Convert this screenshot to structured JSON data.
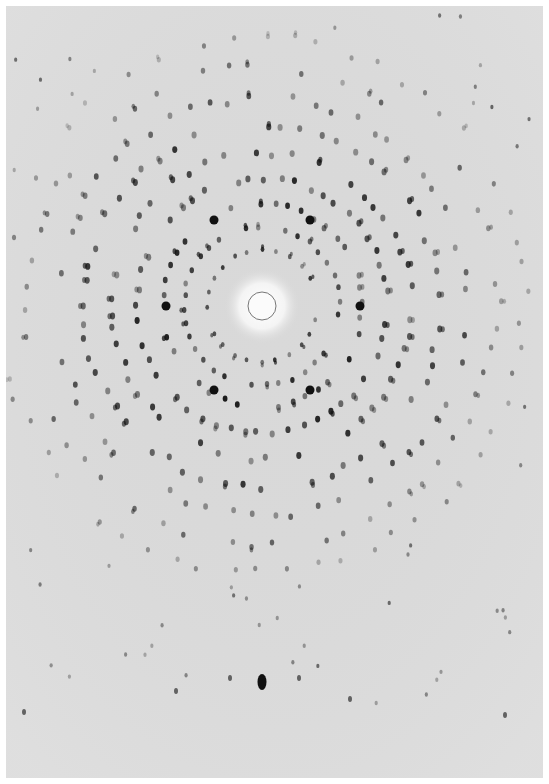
{
  "image": {
    "subject": "X-ray diffraction pattern",
    "background_color": "#d9d9d9",
    "spot_color": "#111111",
    "center": {
      "x": 262,
      "y": 306
    },
    "beamstop_radius": 14,
    "glow_radius": 38,
    "strong_spots": [
      [
        214,
        220
      ],
      [
        310,
        220
      ],
      [
        166,
        306
      ],
      [
        360,
        306
      ],
      [
        214,
        390
      ],
      [
        310,
        390
      ]
    ],
    "lower_row_spots": [
      [
        262,
        682,
        "large"
      ],
      [
        230,
        678,
        "small"
      ],
      [
        299,
        678,
        "small"
      ],
      [
        176,
        691,
        "small"
      ],
      [
        350,
        699,
        "small"
      ],
      [
        24,
        712,
        "small"
      ],
      [
        505,
        715,
        "small"
      ]
    ],
    "rings": [
      {
        "r": 55,
        "n": 24,
        "size": 2.2,
        "opacity": 0.85
      },
      {
        "r": 78,
        "n": 36,
        "size": 2.6,
        "opacity": 0.9
      },
      {
        "r": 100,
        "n": 44,
        "size": 2.8,
        "opacity": 0.95
      },
      {
        "r": 125,
        "n": 52,
        "size": 3.0,
        "opacity": 0.9
      },
      {
        "r": 150,
        "n": 56,
        "size": 3.0,
        "opacity": 0.85
      },
      {
        "r": 178,
        "n": 60,
        "size": 3.0,
        "opacity": 0.85
      },
      {
        "r": 205,
        "n": 60,
        "size": 2.8,
        "opacity": 0.75
      },
      {
        "r": 235,
        "n": 62,
        "size": 2.6,
        "opacity": 0.6
      },
      {
        "r": 262,
        "n": 58,
        "size": 2.4,
        "opacity": 0.45
      }
    ]
  }
}
